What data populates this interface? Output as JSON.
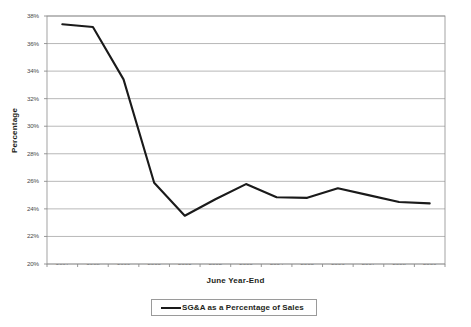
{
  "chart_data": {
    "type": "line",
    "title": "",
    "xlabel": "June Year-End",
    "ylabel": "Percentage",
    "categories": [
      "1997",
      "1998",
      "1999",
      "2000",
      "2001",
      "2002",
      "2003",
      "2004",
      "2005",
      "2006",
      "2007",
      "2008",
      "2009"
    ],
    "series": [
      {
        "name": "SG&A as a Percentage of Sales",
        "color": "#1a1a1a",
        "values": [
          37.4,
          37.2,
          33.4,
          25.9,
          23.5,
          24.7,
          25.8,
          24.85,
          24.8,
          25.5,
          25.0,
          24.5,
          24.4
        ]
      }
    ],
    "ylim": [
      20,
      38
    ],
    "ytick_values": [
      20,
      22,
      24,
      26,
      28,
      30,
      32,
      34,
      36,
      38
    ],
    "ytick_labels": [
      "20%",
      "22%",
      "24%",
      "26%",
      "28%",
      "30%",
      "32%",
      "34%",
      "36%",
      "38%"
    ],
    "grid": "horizontal",
    "legend_position": "bottom",
    "legend_entries": [
      "SG&A as a Percentage of Sales"
    ],
    "markers": false,
    "plot_border": true,
    "gridline_color": "#a6a6a6",
    "axis_color": "#7f7f7f",
    "background": "#ffffff"
  },
  "legend": {
    "label": "SG&A as a Percentage of Sales"
  }
}
